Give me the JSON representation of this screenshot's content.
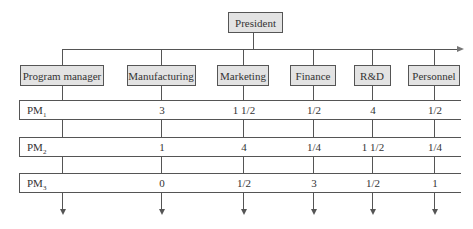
{
  "diagram": {
    "type": "matrix organization chart",
    "top": {
      "label": "President"
    },
    "departments": [
      {
        "label": "Program manager",
        "x": 62
      },
      {
        "label": "Manufacturing",
        "x": 161
      },
      {
        "label": "Marketing",
        "x": 243
      },
      {
        "label": "Finance",
        "x": 313
      },
      {
        "label": "R&D",
        "x": 372
      },
      {
        "label": "Personnel",
        "x": 434
      }
    ],
    "programs": [
      {
        "label": "PM",
        "sub": "1",
        "values": [
          "3",
          "1 1/2",
          "1/2",
          "4",
          "1/2"
        ]
      },
      {
        "label": "PM",
        "sub": "2",
        "values": [
          "1",
          "4",
          "1/4",
          "1 1/2",
          "1/4"
        ]
      },
      {
        "label": "PM",
        "sub": "3",
        "values": [
          "0",
          "1/2",
          "3",
          "1/2",
          "1"
        ]
      }
    ]
  }
}
